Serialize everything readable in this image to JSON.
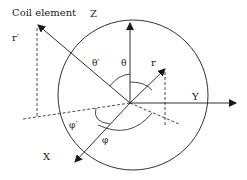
{
  "diagram": {
    "title_label": "Coil element",
    "axes": {
      "z": "Z",
      "y": "Y",
      "x": "X"
    },
    "vectors": {
      "r": "r",
      "r_prime": "r′"
    },
    "angles": {
      "theta": "θ",
      "theta_prime": "θ′",
      "phi": "φ",
      "phi_prime": "φ′"
    },
    "colors": {
      "stroke": "#1a1a1a",
      "background": "#ffffff"
    }
  }
}
